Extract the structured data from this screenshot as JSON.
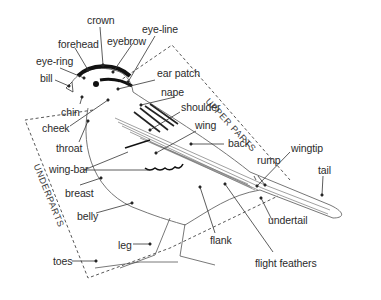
{
  "diagram": {
    "colors": {
      "ink": "#2b2b2b",
      "line": "#555555",
      "background": "#ffffff",
      "cap_stripe": "#111111"
    },
    "regions": [
      {
        "id": "upper",
        "label": "UPPER PARTS"
      },
      {
        "id": "under",
        "label": "UNDERPARTS"
      }
    ],
    "labels": [
      {
        "id": "crown",
        "text": "crown"
      },
      {
        "id": "forehead",
        "text": "forehead"
      },
      {
        "id": "eyebrow",
        "text": "eyebrow"
      },
      {
        "id": "eye-line",
        "text": "eye-line"
      },
      {
        "id": "eye-ring",
        "text": "eye-ring"
      },
      {
        "id": "bill",
        "text": "bill"
      },
      {
        "id": "ear-patch",
        "text": "ear patch"
      },
      {
        "id": "nape",
        "text": "nape"
      },
      {
        "id": "chin",
        "text": "chin"
      },
      {
        "id": "shoulder",
        "text": "shoulder"
      },
      {
        "id": "cheek",
        "text": "cheek"
      },
      {
        "id": "wing",
        "text": "wing"
      },
      {
        "id": "throat",
        "text": "throat"
      },
      {
        "id": "back",
        "text": "back"
      },
      {
        "id": "wing-bar",
        "text": "wing-bar"
      },
      {
        "id": "rump",
        "text": "rump"
      },
      {
        "id": "wingtip",
        "text": "wingtip"
      },
      {
        "id": "breast",
        "text": "breast"
      },
      {
        "id": "tail",
        "text": "tail"
      },
      {
        "id": "belly",
        "text": "belly"
      },
      {
        "id": "undertail",
        "text": "undertail"
      },
      {
        "id": "flank",
        "text": "flank"
      },
      {
        "id": "leg",
        "text": "leg"
      },
      {
        "id": "toes",
        "text": "toes"
      },
      {
        "id": "flight-feathers",
        "text": "flight feathers"
      }
    ]
  }
}
